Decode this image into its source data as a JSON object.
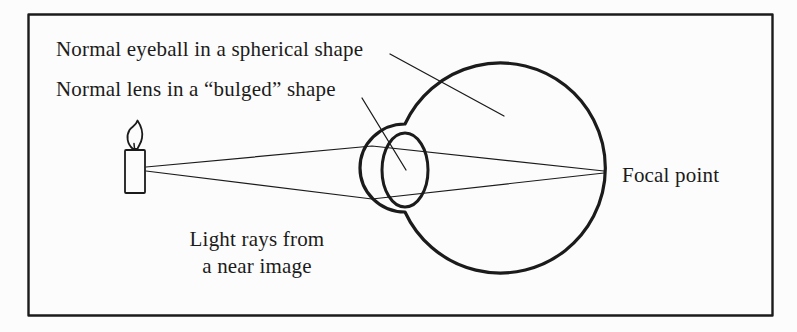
{
  "figure": {
    "labels": {
      "eyeball": "Normal eyeball in a spherical shape",
      "lens": "Normal lens in a “bulged” shape",
      "rays_line1": "Light rays from",
      "rays_line2": "a near image",
      "focal": "Focal point"
    },
    "colors": {
      "ink": "#1b1b1b",
      "paper": "#fcfcfc"
    }
  }
}
